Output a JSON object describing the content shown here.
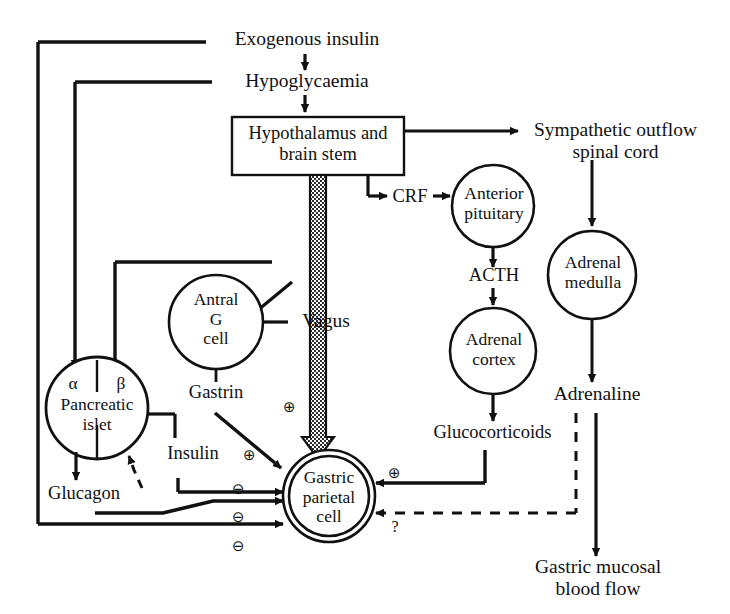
{
  "diagram": {
    "nodes": {
      "exogenous_insulin": "Exogenous insulin",
      "hypoglycaemia": "Hypoglycaemia",
      "hypothalamus": "Hypothalamus and\nbrain stem",
      "sympathetic": "Sympathetic outflow\nspinal cord",
      "crf": "CRF",
      "anterior_pituitary": "Anterior\npituitary",
      "acth": "ACTH",
      "adrenal_cortex": "Adrenal\ncortex",
      "adrenal_medulla": "Adrenal\nmedulla",
      "adrenaline": "Adrenaline",
      "glucocorticoids": "Glucocorticoids",
      "gastric_mucosal": "Gastric mucosal\nblood flow",
      "vagus": "Vagus",
      "antral_g_cell": "Antral\nG\ncell",
      "gastrin": "Gastrin",
      "pancreatic_islet": "Pancreatic\nislet",
      "alpha": "α",
      "beta": "β",
      "insulin": "Insulin",
      "glucagon": "Glucagon",
      "gastric_parietal_cell": "Gastric\nparietal\ncell"
    },
    "signs": {
      "plus_vagus": "⊕",
      "plus_gastrin": "⊕",
      "plus_glucocorticoids": "⊕",
      "minus_insulin": "⊖",
      "minus_glucagon": "⊖",
      "minus_bottom": "⊖",
      "question": "?"
    },
    "colors": {
      "ink": "#111111",
      "background": "#ffffff",
      "hatch": "#2b2b2b"
    }
  }
}
